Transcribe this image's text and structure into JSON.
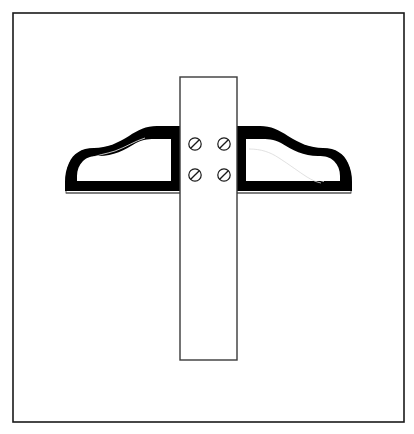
{
  "page": {
    "width": 414,
    "height": 434,
    "background_color": "#ffffff",
    "kind": "patent-line-drawing",
    "title": "",
    "caption": ""
  },
  "frame": {
    "name": "drawing-border",
    "x": 13,
    "y": 13,
    "width": 391,
    "height": 409,
    "stroke_color": "#1a1a1a",
    "stroke_width": 1.6,
    "fill_color": "#ffffff"
  },
  "drawing": {
    "label": "",
    "ink_color": "#000000",
    "outline_color": "#3a3a3a",
    "highlight_color": "#ffffff",
    "strap": {
      "name": "vertical-strap",
      "x": 180,
      "y": 77,
      "width": 57,
      "height": 283,
      "fill_color": "#ffffff",
      "stroke_color": "#3a3a3a",
      "stroke_width": 1.4
    },
    "handles": {
      "left": {
        "name": "left-handle",
        "tip_x": 64,
        "base_y": 193,
        "top_y": 128
      },
      "right": {
        "name": "right-handle",
        "tip_x": 352,
        "base_y": 193,
        "top_y": 128,
        "has_inner_highlight": true
      }
    },
    "screws": [
      {
        "name": "screw-top-left",
        "cx": 195,
        "cy": 144,
        "r": 6.2,
        "slot_angle_deg": 45
      },
      {
        "name": "screw-top-right",
        "cx": 224,
        "cy": 144,
        "r": 6.2,
        "slot_angle_deg": 45
      },
      {
        "name": "screw-bottom-left",
        "cx": 195,
        "cy": 175,
        "r": 6.2,
        "slot_angle_deg": 45
      },
      {
        "name": "screw-bottom-right",
        "cx": 224,
        "cy": 175,
        "r": 6.2,
        "slot_angle_deg": 45
      }
    ]
  }
}
